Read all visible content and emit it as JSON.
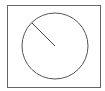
{
  "diagram": {
    "shapes": [
      "frame",
      "circle",
      "radius-line"
    ],
    "stroke_color": "#555555",
    "background_color": "#ffffff",
    "radius_angle_deg": 135
  }
}
